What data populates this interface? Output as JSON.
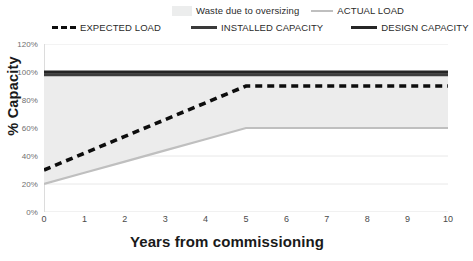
{
  "chart_data": {
    "type": "line",
    "title": "",
    "xlabel": "Years from commissioning",
    "ylabel": "% Capacity",
    "xlim": [
      0,
      10
    ],
    "ylim": [
      0,
      120
    ],
    "grid": true,
    "legend_position": "top",
    "x_ticks": [
      "0",
      "1",
      "2",
      "3",
      "4",
      "5",
      "6",
      "7",
      "8",
      "9",
      "10"
    ],
    "y_ticks": [
      "0%",
      "20%",
      "40%",
      "60%",
      "80%",
      "100%",
      "120%"
    ],
    "x": [
      0,
      1,
      2,
      3,
      4,
      5,
      6,
      7,
      8,
      9,
      10
    ],
    "series": [
      {
        "name": "Waste due to oversizing",
        "style": "area-fill",
        "color": "#ececec",
        "values": [
          80,
          78,
          76,
          74,
          72,
          38,
          38,
          38,
          38,
          38,
          38
        ]
      },
      {
        "name": "ACTUAL LOAD",
        "style": "solid-thin",
        "color": "#bfbfbf",
        "values": [
          20,
          28,
          36,
          44,
          52,
          60,
          60,
          60,
          60,
          60,
          60
        ]
      },
      {
        "name": "EXPECTED LOAD",
        "style": "dashed-thick",
        "color": "#0d0d0d",
        "values": [
          30,
          42,
          54,
          66,
          78,
          90,
          90,
          90,
          90,
          90,
          90
        ]
      },
      {
        "name": "INSTALLED CAPACITY",
        "style": "solid-thick",
        "color": "#3d3d3d",
        "values": [
          98,
          98,
          98,
          98,
          98,
          98,
          98,
          98,
          98,
          98,
          98
        ]
      },
      {
        "name": "DESIGN CAPACITY",
        "style": "solid-thick",
        "color": "#242424",
        "values": [
          100,
          100,
          100,
          100,
          100,
          100,
          100,
          100,
          100,
          100,
          100
        ]
      }
    ]
  },
  "legend": {
    "row1": [
      {
        "label": "Waste due to oversizing",
        "swatch": "area-swatch"
      },
      {
        "label": "ACTUAL LOAD",
        "swatch": "light-line-swatch"
      }
    ],
    "row2": [
      {
        "label": "EXPECTED LOAD",
        "swatch": "dashed-line-swatch"
      },
      {
        "label": "INSTALLED CAPACITY",
        "swatch": "solid-line-swatch"
      },
      {
        "label": "DESIGN CAPACITY",
        "swatch": "solid-line-swatch"
      }
    ]
  },
  "axes": {
    "y_title": "% Capacity",
    "x_title": "Years from commissioning",
    "y_labels": [
      "120%",
      "100%",
      "80%",
      "60%",
      "40%",
      "20%",
      "0%"
    ],
    "x_labels": [
      "0",
      "1",
      "2",
      "3",
      "4",
      "5",
      "6",
      "7",
      "8",
      "9",
      "10"
    ]
  },
  "colors": {
    "waste_fill": "#ececec",
    "actual_load": "#bfbfbf",
    "expected_load": "#0d0d0d",
    "installed_capacity": "#3d3d3d",
    "design_capacity": "#242424",
    "gridline": "#e2e2e2",
    "axis_text": "#6f6f6f"
  }
}
